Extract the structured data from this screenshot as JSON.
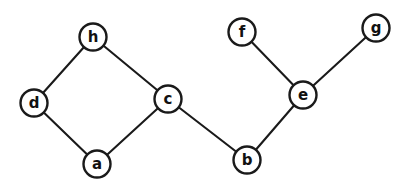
{
  "figure": {
    "kind": "undirected-graph",
    "background_color": "#ffffff",
    "ink_color": "#1a1a1a",
    "node_fill_color": "#ffffff",
    "node_radius": 13.5,
    "width": 411,
    "height": 195,
    "nodes": [
      {
        "id": "h",
        "label": "h",
        "x": 93,
        "y": 37
      },
      {
        "id": "d",
        "label": "d",
        "x": 34,
        "y": 103
      },
      {
        "id": "c",
        "label": "c",
        "x": 168,
        "y": 99
      },
      {
        "id": "a",
        "label": "a",
        "x": 97,
        "y": 164
      },
      {
        "id": "f",
        "label": "f",
        "x": 242,
        "y": 32
      },
      {
        "id": "g",
        "label": "g",
        "x": 376,
        "y": 28
      },
      {
        "id": "e",
        "label": "e",
        "x": 303,
        "y": 95
      },
      {
        "id": "b",
        "label": "b",
        "x": 247,
        "y": 160
      }
    ],
    "edges": [
      {
        "from": "h",
        "to": "d"
      },
      {
        "from": "h",
        "to": "c"
      },
      {
        "from": "d",
        "to": "a"
      },
      {
        "from": "a",
        "to": "c"
      },
      {
        "from": "c",
        "to": "b"
      },
      {
        "from": "b",
        "to": "e"
      },
      {
        "from": "e",
        "to": "f"
      },
      {
        "from": "e",
        "to": "g"
      }
    ]
  }
}
